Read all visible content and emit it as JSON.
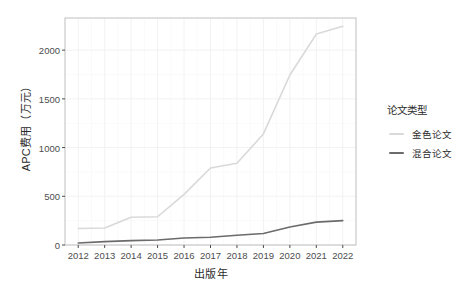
{
  "chart_data": {
    "type": "line",
    "title": "",
    "xlabel": "出版年",
    "ylabel": "APC费用（万元）",
    "categories": [
      "2012",
      "2013",
      "2014",
      "2015",
      "2016",
      "2017",
      "2018",
      "2019",
      "2020",
      "2021",
      "2022"
    ],
    "x": [
      2012,
      2013,
      2014,
      2015,
      2016,
      2017,
      2018,
      2019,
      2020,
      2021,
      2022
    ],
    "xlim": [
      2011.5,
      2022.5
    ],
    "ylim": [
      0,
      2330
    ],
    "yticks": [
      0,
      500,
      1000,
      1500,
      2000
    ],
    "ytick_labels": [
      "0",
      "500",
      "1000",
      "1500",
      "2000"
    ],
    "grid": true,
    "legend_position": "right",
    "legend_title": "论文类型",
    "series": [
      {
        "name": "金色论文",
        "color": "#d9d9d9",
        "values": [
          170,
          175,
          285,
          290,
          520,
          790,
          840,
          1140,
          1745,
          2165,
          2245
        ]
      },
      {
        "name": "混合论文",
        "color": "#6b6b6b",
        "values": [
          20,
          35,
          45,
          52,
          72,
          80,
          100,
          118,
          185,
          235,
          250
        ]
      }
    ]
  },
  "panel": {
    "background": "#ffffff",
    "border_color": "#bfbfbf",
    "grid_major_color": "#f2f2f2",
    "grid_minor_color": "#fafafa"
  },
  "axes": {
    "tick_color": "#4d4d4d",
    "text_color": "#2a2a2a"
  }
}
